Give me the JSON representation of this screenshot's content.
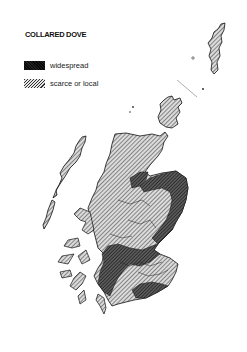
{
  "map": {
    "title": "COLLARED DOVE",
    "subject": "Distribution of the Collared Dove in Scotland",
    "legend": [
      {
        "label": "widespread",
        "pattern": "dense-dark-hatch",
        "color": "#444444"
      },
      {
        "label": "scarce or local",
        "pattern": "light-diagonal-hatch",
        "color": "#b5b5b5"
      }
    ],
    "regions": [
      {
        "name": "Shetland",
        "category": "scarce or local"
      },
      {
        "name": "Orkney",
        "category": "scarce or local"
      },
      {
        "name": "Outer Hebrides",
        "category": "scarce or local"
      },
      {
        "name": "Highlands",
        "category": "scarce or local"
      },
      {
        "name": "Moray Firth coast",
        "category": "widespread"
      },
      {
        "name": "North-east & east coast",
        "category": "widespread"
      },
      {
        "name": "Central Belt",
        "category": "widespread"
      },
      {
        "name": "Southern Uplands",
        "category": "scarce or local"
      },
      {
        "name": "Solway coast",
        "category": "widespread"
      }
    ]
  }
}
